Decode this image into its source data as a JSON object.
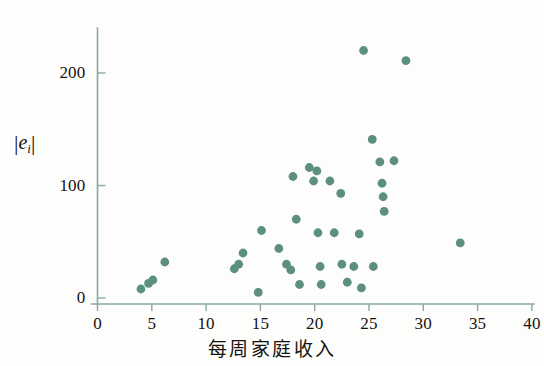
{
  "chart_data": {
    "type": "scatter",
    "title": "",
    "xlabel": "每周家庭收入",
    "ylabel": "|ê_i|",
    "xlim": [
      0,
      40
    ],
    "ylim": [
      0,
      250
    ],
    "xticks": [
      0,
      5,
      10,
      15,
      20,
      25,
      30,
      35,
      40
    ],
    "xtick_labels": [
      "0",
      "5",
      "10",
      "15",
      "20",
      "25",
      "30",
      "35",
      "40"
    ],
    "yticks": [
      0,
      100,
      200
    ],
    "ytick_labels": [
      "0",
      "100",
      "200"
    ],
    "grid": false,
    "legend": null,
    "marker_color": "#5d8f80",
    "axis_color": "#8aa99c",
    "points": [
      {
        "x": 4.0,
        "y": 8
      },
      {
        "x": 4.7,
        "y": 13
      },
      {
        "x": 5.1,
        "y": 16
      },
      {
        "x": 6.2,
        "y": 32
      },
      {
        "x": 12.6,
        "y": 26
      },
      {
        "x": 13.0,
        "y": 30
      },
      {
        "x": 13.4,
        "y": 40
      },
      {
        "x": 14.8,
        "y": 5
      },
      {
        "x": 15.1,
        "y": 60
      },
      {
        "x": 16.7,
        "y": 44
      },
      {
        "x": 17.4,
        "y": 30
      },
      {
        "x": 17.8,
        "y": 25
      },
      {
        "x": 18.0,
        "y": 108
      },
      {
        "x": 18.3,
        "y": 70
      },
      {
        "x": 18.6,
        "y": 12
      },
      {
        "x": 19.5,
        "y": 116
      },
      {
        "x": 19.9,
        "y": 104
      },
      {
        "x": 20.2,
        "y": 113
      },
      {
        "x": 20.3,
        "y": 58
      },
      {
        "x": 20.5,
        "y": 28
      },
      {
        "x": 20.6,
        "y": 12
      },
      {
        "x": 21.4,
        "y": 104
      },
      {
        "x": 21.8,
        "y": 58
      },
      {
        "x": 22.4,
        "y": 93
      },
      {
        "x": 22.5,
        "y": 30
      },
      {
        "x": 23.0,
        "y": 14
      },
      {
        "x": 23.6,
        "y": 28
      },
      {
        "x": 24.1,
        "y": 57
      },
      {
        "x": 24.3,
        "y": 9
      },
      {
        "x": 24.5,
        "y": 220
      },
      {
        "x": 25.3,
        "y": 141
      },
      {
        "x": 25.4,
        "y": 28
      },
      {
        "x": 26.0,
        "y": 121
      },
      {
        "x": 26.2,
        "y": 102
      },
      {
        "x": 26.3,
        "y": 90
      },
      {
        "x": 26.4,
        "y": 77
      },
      {
        "x": 27.3,
        "y": 122
      },
      {
        "x": 28.4,
        "y": 211
      },
      {
        "x": 33.4,
        "y": 49
      }
    ]
  },
  "axis_titles": {
    "x": "每周家庭收入",
    "y_parts": {
      "bar_left": "|",
      "symbol": "e",
      "subscript": "i",
      "bar_right": "|"
    }
  }
}
